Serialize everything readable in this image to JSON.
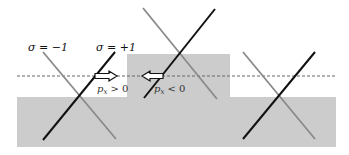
{
  "colors": {
    "background": "#ffffff",
    "region": "#cccccc",
    "black_line": "#111111",
    "gray_line": "#8a8a8a",
    "dashed": "#666666"
  },
  "labels": {
    "sigma_minus": "σ = −1",
    "sigma_plus": "σ = +1",
    "px_positive": "p",
    "px_positive_sub": "x",
    "px_positive_rel": " > 0",
    "px_negative": "p",
    "px_negative_sub": "x",
    "px_negative_rel": " < 0"
  },
  "arrows": [
    {
      "direction": "right",
      "label": "p_x > 0"
    },
    {
      "direction": "left",
      "label": "p_x < 0"
    }
  ],
  "crossings": [
    {
      "name": "left",
      "position": "lower-level"
    },
    {
      "name": "center",
      "position": "raised-step"
    },
    {
      "name": "right",
      "position": "lower-level"
    }
  ]
}
